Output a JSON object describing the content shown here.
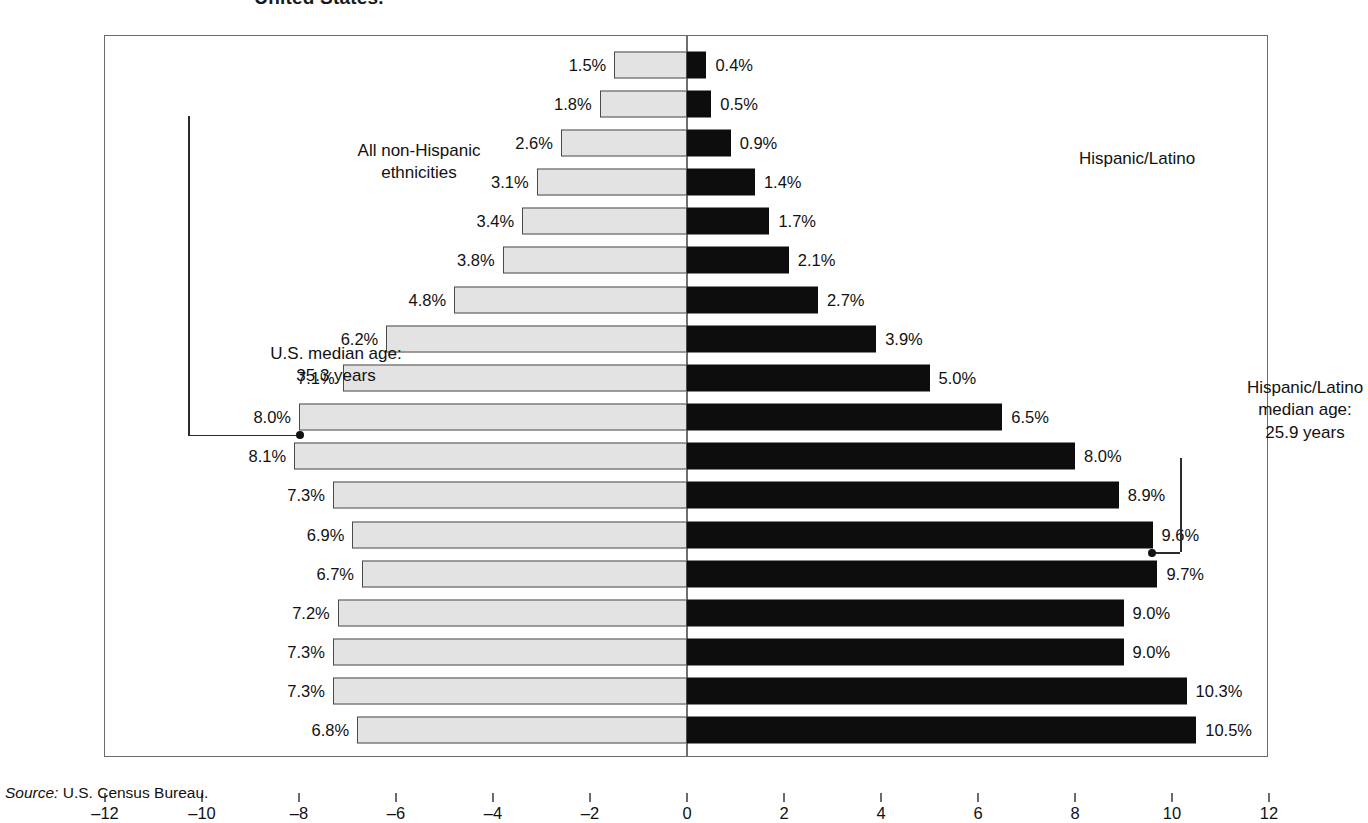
{
  "title": "United States.",
  "captions": {
    "left": "All non-Hispanic\nethnicities",
    "right": "Hispanic/Latino"
  },
  "annotations": {
    "us_median": "U.S. median age:\n35.3 years",
    "hispanic_median": "Hispanic/Latino\nmedian age:\n25.9 years"
  },
  "source": {
    "label": "Source:",
    "text": "U.S. Census Bureau."
  },
  "colors": {
    "left_bar_fill": "#e3e3e3",
    "left_bar_border": "#4a4a4a",
    "right_bar_fill": "#0d0d0d",
    "frame": "#6b6b6b",
    "text": "#111111"
  },
  "chart_data": {
    "type": "bar",
    "orientation": "horizontal",
    "subtype": "population-pyramid",
    "title": "United States.",
    "xlabel": "",
    "ylabel": "",
    "xlim": [
      -12,
      12
    ],
    "xticks": [
      -12,
      -10,
      -8,
      -6,
      -4,
      -2,
      0,
      2,
      4,
      6,
      8,
      10,
      12
    ],
    "xticklabels": [
      "–12",
      "–10",
      "–8",
      "–6",
      "–4",
      "–2",
      "0",
      "2",
      "4",
      "6",
      "8",
      "10",
      "12"
    ],
    "grid": false,
    "legend": "inline-captions",
    "categories": [
      "Over 85",
      "80–84",
      "75–79",
      "70–74",
      "65–69",
      "60–64",
      "55–59",
      "50–54",
      "45–49",
      "40–44",
      "35–39",
      "30–34",
      "25–29",
      "20–24",
      "15–19",
      "10–14",
      "5–9",
      "Under 5"
    ],
    "series": [
      {
        "name": "All non-Hispanic ethnicities",
        "side": "left",
        "values": [
          1.5,
          1.8,
          2.6,
          3.1,
          3.4,
          3.8,
          4.8,
          6.2,
          7.1,
          8.0,
          8.1,
          7.3,
          6.9,
          6.7,
          7.2,
          7.3,
          7.3,
          6.8
        ],
        "labels": [
          "1.5%",
          "1.8%",
          "2.6%",
          "3.1%",
          "3.4%",
          "3.8%",
          "4.8%",
          "6.2%",
          "7.1%",
          "8.0%",
          "8.1%",
          "7.3%",
          "6.9%",
          "6.7%",
          "7.2%",
          "7.3%",
          "7.3%",
          "6.8%"
        ]
      },
      {
        "name": "Hispanic/Latino",
        "side": "right",
        "values": [
          0.4,
          0.5,
          0.9,
          1.4,
          1.7,
          2.1,
          2.7,
          3.9,
          5.0,
          6.5,
          8.0,
          8.9,
          9.6,
          9.7,
          9.0,
          9.0,
          10.3,
          10.5
        ],
        "labels": [
          "0.4%",
          "0.5%",
          "0.9%",
          "1.4%",
          "1.7%",
          "2.1%",
          "2.7%",
          "3.9%",
          "5.0%",
          "6.5%",
          "8.0%",
          "8.9%",
          "9.6%",
          "9.7%",
          "9.0%",
          "9.0%",
          "10.3%",
          "10.5%"
        ]
      }
    ],
    "annotations": [
      {
        "name": "us-median-age",
        "text": "U.S. median age: 35.3 years",
        "value": 35.3,
        "points_to_row": 10,
        "side": "left"
      },
      {
        "name": "hispanic-median-age",
        "text": "Hispanic/Latino median age: 25.9 years",
        "value": 25.9,
        "points_to_row": 13,
        "side": "right"
      }
    ],
    "source": "Source: U.S. Census Bureau."
  }
}
